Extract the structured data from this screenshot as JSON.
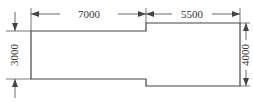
{
  "diagram": {
    "dimensions": {
      "top_left": "7000",
      "top_right": "5500",
      "left": "3000",
      "right": "4000"
    },
    "colors": {
      "line": "#444444",
      "text": "#333333",
      "background": "#ffffff"
    }
  }
}
